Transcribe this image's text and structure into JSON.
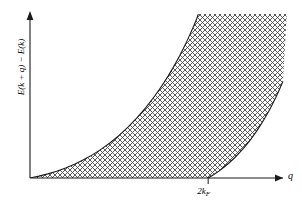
{
  "chart_data": {
    "type": "area",
    "title": "",
    "subtitle": "",
    "xlabel": "q",
    "ylabel": "E(k + q) − E(k)",
    "ylabel_parts": {
      "e1": "E",
      "open1": "(",
      "k1": "k",
      "plus": " + ",
      "q1": "q",
      "close1": ")",
      "minus": " − ",
      "e2": "E",
      "open2": "(",
      "k2": "k",
      "close2": ")"
    },
    "xticks": [
      {
        "value": 1.0,
        "label": "2k",
        "sublabel": "F",
        "label_full": "2k_F"
      }
    ],
    "yticks": [],
    "xlim": [
      0,
      1.42
    ],
    "ylim": [
      0,
      1.12
    ],
    "grid": false,
    "legend": null,
    "annotations": [],
    "axis_arrows": {
      "x": true,
      "y": true
    },
    "shading": {
      "name": "particle-hole-continuum",
      "pattern": "cross-hatch",
      "pattern_spacing_px": 5,
      "pattern_color": "#555555",
      "description": "Region between lower and upper boundary curves"
    },
    "series": [
      {
        "name": "upper-boundary",
        "kind": "curve",
        "note": "E = q^2 + 2q (rises from origin, exits top of frame)",
        "points": [
          [
            0.0,
            0.0
          ],
          [
            0.05,
            0.013
          ],
          [
            0.1,
            0.028
          ],
          [
            0.15,
            0.046
          ],
          [
            0.2,
            0.068
          ],
          [
            0.25,
            0.094
          ],
          [
            0.3,
            0.124
          ],
          [
            0.35,
            0.158
          ],
          [
            0.4,
            0.197
          ],
          [
            0.45,
            0.241
          ],
          [
            0.5,
            0.291
          ],
          [
            0.55,
            0.347
          ],
          [
            0.6,
            0.41
          ],
          [
            0.65,
            0.481
          ],
          [
            0.7,
            0.56
          ],
          [
            0.725,
            0.603
          ],
          [
            0.75,
            0.648
          ],
          [
            0.775,
            0.696
          ],
          [
            0.8,
            0.747
          ],
          [
            0.82,
            0.79
          ],
          [
            0.84,
            0.835
          ],
          [
            0.86,
            0.883
          ],
          [
            0.88,
            0.933
          ],
          [
            0.9,
            0.986
          ],
          [
            0.92,
            1.042
          ],
          [
            0.935,
            1.086
          ],
          [
            0.945,
            1.12
          ]
        ]
      },
      {
        "name": "lower-boundary",
        "kind": "curve",
        "note": "E = q^2 - 2q for q > 2k_F; zero below 2k_F",
        "points": [
          [
            1.0,
            0.0
          ],
          [
            1.03,
            0.022
          ],
          [
            1.06,
            0.047
          ],
          [
            1.09,
            0.075
          ],
          [
            1.12,
            0.106
          ],
          [
            1.15,
            0.14
          ],
          [
            1.18,
            0.178
          ],
          [
            1.21,
            0.22
          ],
          [
            1.24,
            0.266
          ],
          [
            1.27,
            0.317
          ],
          [
            1.3,
            0.373
          ],
          [
            1.32,
            0.413
          ],
          [
            1.34,
            0.456
          ],
          [
            1.36,
            0.502
          ],
          [
            1.38,
            0.551
          ],
          [
            1.4,
            0.604
          ],
          [
            1.415,
            0.646
          ],
          [
            1.42,
            0.661
          ]
        ]
      },
      {
        "name": "baseline-segment",
        "kind": "segment",
        "note": "Shaded region bottom edge along q-axis from 0 to 2k_F",
        "points": [
          [
            0.0,
            0.0
          ],
          [
            1.0,
            0.0
          ]
        ]
      }
    ]
  },
  "figure": {
    "background_color": "#ffffff",
    "axis_color": "#1a1a1a",
    "curve_color": "#1a1a1a"
  }
}
